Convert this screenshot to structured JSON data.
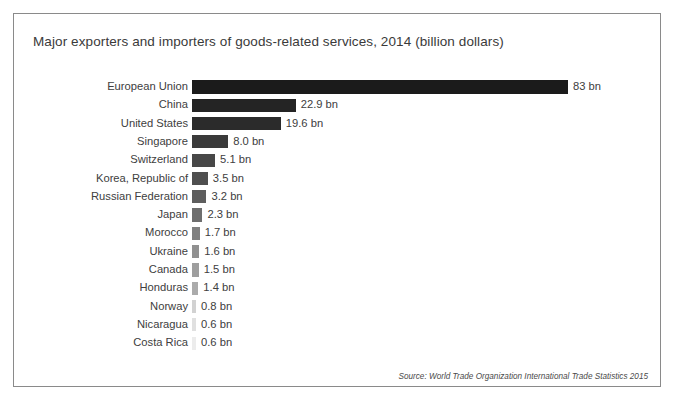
{
  "frame": {
    "border_color": "#8a8a8a",
    "background": "#ffffff"
  },
  "title": "Major exporters and importers of goods-related services, 2014 (billion dollars)",
  "source": "Source: World Trade Organization International Trade Statistics 2015",
  "chart_data": {
    "type": "bar",
    "orientation": "horizontal",
    "title": "Major exporters and importers of goods-related services, 2014 (billion dollars)",
    "xlabel": "",
    "ylabel": "",
    "unit": "bn",
    "xlim": [
      0,
      83
    ],
    "grid": false,
    "legend": false,
    "axis_visible": false,
    "categories": [
      "European Union",
      "China",
      "United States",
      "Singapore",
      "Switzerland",
      "Korea, Republic of",
      "Russian Federation",
      "Japan",
      "Morocco",
      "Ukraine",
      "Canada",
      "Honduras",
      "Norway",
      "Nicaragua",
      "Costa Rica"
    ],
    "values": [
      83,
      22.9,
      19.6,
      8.0,
      5.1,
      3.5,
      3.2,
      2.3,
      1.7,
      1.6,
      1.5,
      1.4,
      0.8,
      0.6,
      0.6
    ],
    "value_labels": [
      "83 bn",
      "22.9 bn",
      "19.6 bn",
      "8.0 bn",
      "5.1 bn",
      "3.5 bn",
      "3.2 bn",
      "2.3 bn",
      "1.7 bn",
      "1.6 bn",
      "1.5 bn",
      "1.4 bn",
      "0.8 bn",
      "0.6 bn",
      "0.6 bn"
    ],
    "bar_colors": [
      "#1b1b1b",
      "#242424",
      "#2b2b2b",
      "#3a3a3a",
      "#474747",
      "#4f4f4f",
      "#5e5e5e",
      "#6e6e6e",
      "#808080",
      "#909090",
      "#9e9e9e",
      "#ababab",
      "#d2d2d2",
      "#e0e0e0",
      "#ececec"
    ]
  }
}
